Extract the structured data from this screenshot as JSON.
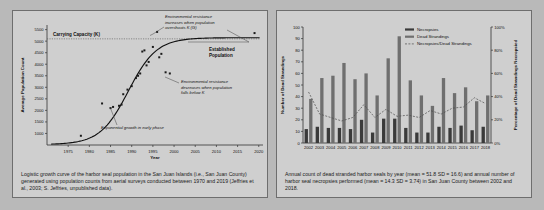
{
  "figure_left": {
    "name": "logistic-growth-curve",
    "caption": "Logistic growth curve of the harbor seal population in the San Juan Islands (i.e., San Juan County) generated using population counts from aerial surveys conducted between 1970 and 2019 (Jeffries et al., 2003; S. Jeffries, unpublished data).",
    "annotations": {
      "carrying_capacity": "Carrying Capacity (K)",
      "established_population": "Established\nPopulation",
      "overshoot": "Environmental resistance increases when population overshoots K (G)",
      "overshoot_l1": "Environmental resistance",
      "overshoot_l2": "increases when population",
      "overshoot_l3": "overshoots K (G)",
      "undershoot_l1": "Environmental resistance",
      "undershoot_l2": "decreases when population",
      "undershoot_l3": "falls below K",
      "exponential": "Exponential growth in early phase",
      "established_l1": "Established",
      "established_l2": "Population"
    },
    "colors": {
      "point": "#1a1a1a",
      "curve": "#111111",
      "axis": "#333333",
      "panel_bg": "#cfcfcf"
    }
  },
  "figure_right": {
    "name": "strandings-necropsies-bar-chart",
    "caption": "Annual count of dead stranded harbor seals by year (mean = 51.8 SD = 16.6) and annual number of harbor seal necropsies performed (mean = 14.3 SD = 3.74) in San Juan County between 2002 and 2018.",
    "colors": {
      "necropsies": "#3a3a3a",
      "strandings": "#6f6f6f",
      "ratio_line": "#4a4a4a",
      "axis": "#333333",
      "panel_bg": "#cfcfcf"
    }
  },
  "chart_data": [
    {
      "type": "scatter",
      "name": "logistic-growth",
      "title": "",
      "xlabel": "Year",
      "ylabel": "Average Population Count",
      "xlim": [
        1970,
        2021
      ],
      "ylim": [
        500,
        5700
      ],
      "xticks": [
        1975,
        1980,
        1985,
        1990,
        1995,
        2000,
        2005,
        2010,
        2015,
        2020
      ],
      "yticks": [
        1000,
        1500,
        2000,
        2500,
        3000,
        3500,
        4000,
        4500,
        5000,
        5500
      ],
      "grid": false,
      "carrying_capacity": 5100,
      "x": [
        1978,
        1983,
        1985,
        1985.5,
        1987,
        1987.5,
        1988,
        1989,
        1990,
        1991,
        1991.5,
        1992,
        1992.5,
        1993,
        1993.5,
        1994,
        1995,
        1996,
        1996.5,
        1997,
        1998,
        1999,
        2019
      ],
      "values": [
        900,
        2300,
        2100,
        2150,
        2200,
        2250,
        2700,
        2900,
        3050,
        3400,
        3500,
        3600,
        4550,
        4600,
        3950,
        4100,
        4750,
        5400,
        4300,
        4450,
        3650,
        3600,
        5350
      ],
      "series": [
        {
          "name": "Average Population Count",
          "points": [
            {
              "year": 1978,
              "count": 900
            },
            {
              "year": 1983,
              "count": 2300
            },
            {
              "year": 1985,
              "count": 2100
            },
            {
              "year": 1985.6,
              "count": 2150
            },
            {
              "year": 1987,
              "count": 2200
            },
            {
              "year": 1987.6,
              "count": 2250
            },
            {
              "year": 1988,
              "count": 2700
            },
            {
              "year": 1989,
              "count": 2900
            },
            {
              "year": 1990,
              "count": 3050
            },
            {
              "year": 1991,
              "count": 3400
            },
            {
              "year": 1991.5,
              "count": 3500
            },
            {
              "year": 1992,
              "count": 3600
            },
            {
              "year": 1992.5,
              "count": 4550
            },
            {
              "year": 1993,
              "count": 4600
            },
            {
              "year": 1993.5,
              "count": 3950
            },
            {
              "year": 1994,
              "count": 4100
            },
            {
              "year": 1995,
              "count": 4750
            },
            {
              "year": 1996,
              "count": 5400
            },
            {
              "year": 1996.5,
              "count": 4300
            },
            {
              "year": 1997,
              "count": 4450
            },
            {
              "year": 1998,
              "count": 3650
            },
            {
              "year": 1999,
              "count": 3600
            },
            {
              "year": 2019,
              "count": 5350
            }
          ]
        }
      ]
    },
    {
      "type": "bar",
      "name": "strandings-vs-necropsies",
      "title": "",
      "xlabel": "",
      "ylabel": "Number of Dead Strandings",
      "y2label": "Percentage of Dead Strandings Necropsied",
      "ylim": [
        0,
        100
      ],
      "y2lim": [
        0,
        100
      ],
      "yticks": [
        0,
        10,
        20,
        30,
        40,
        50,
        60,
        70,
        80,
        90,
        100
      ],
      "y2ticks": [
        "0%",
        "20%",
        "40%",
        "60%",
        "80%",
        "100%"
      ],
      "grid": false,
      "legend_position": "top-right",
      "categories": [
        "2002",
        "2003",
        "2004",
        "2005",
        "2006",
        "2007",
        "2008",
        "2009",
        "2010",
        "2011",
        "2012",
        "2013",
        "2014",
        "2015",
        "2016",
        "2017",
        "2018"
      ],
      "series": [
        {
          "name": "Necropsies",
          "values": [
            12,
            14,
            13,
            13,
            12,
            20,
            9,
            21,
            21,
            13,
            9,
            9,
            14,
            13,
            15,
            11,
            14
          ]
        },
        {
          "name": "Dead Strandings",
          "values": [
            38,
            56,
            58,
            69,
            55,
            60,
            41,
            73,
            92,
            54,
            41,
            32,
            56,
            43,
            48,
            36,
            41
          ]
        },
        {
          "name": "Necropsies/Dead Strandings",
          "values": [
            44,
            25,
            22,
            19,
            22,
            33,
            22,
            29,
            23,
            24,
            22,
            28,
            25,
            30,
            31,
            39,
            34
          ],
          "style": "dashed-line",
          "axis": "y2"
        }
      ]
    }
  ]
}
